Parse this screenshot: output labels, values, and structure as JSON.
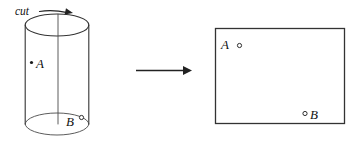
{
  "figure": {
    "background_color": "#ffffff",
    "stroke_color": "#333333",
    "label_color": "#111111"
  },
  "cylinder": {
    "name": "cylinder",
    "cut_label": "cut",
    "cut_arrow_icon": "curved-arrow-right-icon",
    "cut_line_icon": "vertical-cut-line-icon",
    "top_ellipse_icon": "ellipse-icon",
    "bottom_ellipse_icon": "ellipse-icon",
    "points": [
      {
        "label": "A",
        "marker": "filled-dot",
        "marker_side": "left"
      },
      {
        "label": "B",
        "marker": "open-dot",
        "marker_side": "right"
      }
    ],
    "geometry": {
      "center_x": 57,
      "top_center_y": 25,
      "bottom_center_y": 124,
      "radius_x": 32,
      "radius_y": 11,
      "cut_line_x": 58
    }
  },
  "transform_arrow": {
    "name": "transformation-arrow",
    "icon": "arrow-right-icon",
    "x_start": 136,
    "x_end": 191,
    "y": 70
  },
  "rectangle": {
    "name": "unrolled-rectangle",
    "points": [
      {
        "label": "A",
        "marker": "open-dot",
        "marker_side": "right"
      },
      {
        "label": "B",
        "marker": "open-dot",
        "marker_side": "left"
      }
    ],
    "geometry": {
      "left": 215,
      "top": 28,
      "right": 345,
      "bottom": 124,
      "width": 130,
      "height": 96
    }
  }
}
